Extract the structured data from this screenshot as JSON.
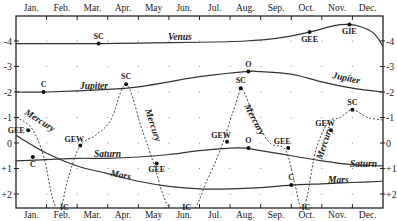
{
  "chart_data": {
    "type": "line",
    "title": "",
    "xlabel": "",
    "ylabel": "",
    "x_tick_labels": [
      "Jan.",
      "Feb.",
      "Mar.",
      "Apr.",
      "May",
      "Jun.",
      "Jul.",
      "Aug.",
      "Sep.",
      "Oct.",
      "Nov.",
      "Dec."
    ],
    "y_tick_labels_left": [
      "-4",
      "-3",
      "-2",
      "-1",
      "0",
      "+1",
      "+2"
    ],
    "y_tick_labels_right": [
      "-4",
      "-3",
      "-2",
      "-1",
      "0",
      "+1",
      "+2"
    ],
    "ylim": [
      2.5,
      -4.8
    ],
    "y_inverted": true,
    "grid": "dots",
    "x_unit": "month (fractional, 0 = Jan 1, 12 = Dec 31)",
    "series": [
      {
        "name": "Venus",
        "style": "solid",
        "points": [
          [
            0,
            -3.9
          ],
          [
            2,
            -3.9
          ],
          [
            2.7,
            -3.9
          ],
          [
            4,
            -3.92
          ],
          [
            6,
            -3.95
          ],
          [
            7.5,
            -4.0
          ],
          [
            8.5,
            -4.1
          ],
          [
            9.6,
            -4.35
          ],
          [
            10.4,
            -4.6
          ],
          [
            10.85,
            -4.65
          ],
          [
            11.3,
            -4.55
          ],
          [
            11.7,
            -4.3
          ],
          [
            12,
            -3.8
          ]
        ]
      },
      {
        "name": "Jupiter",
        "style": "solid",
        "points": [
          [
            0,
            -2.0
          ],
          [
            1,
            -2.0
          ],
          [
            3,
            -2.1
          ],
          [
            4,
            -2.2
          ],
          [
            5,
            -2.4
          ],
          [
            6,
            -2.6
          ],
          [
            7.5,
            -2.8
          ],
          [
            8,
            -2.8
          ],
          [
            9,
            -2.7
          ],
          [
            10,
            -2.4
          ],
          [
            11,
            -2.15
          ],
          [
            12,
            -2.0
          ]
        ]
      },
      {
        "name": "Saturn",
        "style": "solid",
        "points": [
          [
            0,
            0.7
          ],
          [
            1,
            0.65
          ],
          [
            2,
            0.6
          ],
          [
            3,
            0.6
          ],
          [
            4,
            0.55
          ],
          [
            5,
            0.45
          ],
          [
            6,
            0.3
          ],
          [
            7,
            0.2
          ],
          [
            7.5,
            0.2
          ],
          [
            8,
            0.3
          ],
          [
            9,
            0.5
          ],
          [
            10,
            0.7
          ],
          [
            11,
            0.85
          ],
          [
            12,
            0.9
          ]
        ]
      },
      {
        "name": "Mars",
        "style": "solid",
        "points": [
          [
            0,
            -0.3
          ],
          [
            1,
            0.4
          ],
          [
            2,
            0.9
          ],
          [
            3,
            1.2
          ],
          [
            4,
            1.5
          ],
          [
            5,
            1.7
          ],
          [
            6,
            1.8
          ],
          [
            7,
            1.8
          ],
          [
            8,
            1.75
          ],
          [
            9,
            1.65
          ],
          [
            10,
            1.6
          ],
          [
            11,
            1.55
          ],
          [
            12,
            1.5
          ]
        ]
      },
      {
        "name": "Mercury",
        "style": "dashed",
        "points": [
          [
            0,
            -1.0
          ],
          [
            0.5,
            -0.6
          ],
          [
            0.9,
            0.5
          ],
          [
            1.2,
            2.2
          ],
          [
            1.45,
            2.6
          ],
          [
            1.7,
            1.4
          ],
          [
            2.1,
            0.1
          ],
          [
            2.6,
            -0.3
          ],
          [
            3.1,
            -0.9
          ],
          [
            3.6,
            -2.3
          ],
          [
            4.1,
            -0.6
          ],
          [
            4.5,
            0.8
          ],
          [
            4.8,
            2.0
          ],
          [
            5.1,
            2.6
          ],
          [
            5.8,
            2.6
          ],
          [
            6.2,
            1.6
          ],
          [
            6.7,
            0.2
          ],
          [
            7.2,
            -1.6
          ],
          [
            7.4,
            -2.1
          ],
          [
            7.8,
            -1.0
          ],
          [
            8.3,
            0.0
          ],
          [
            8.8,
            0.25
          ],
          [
            9.1,
            1.5
          ],
          [
            9.3,
            2.5
          ],
          [
            9.5,
            2.2
          ],
          [
            9.8,
            0.3
          ],
          [
            10.2,
            -0.8
          ],
          [
            10.6,
            -1.0
          ],
          [
            11.0,
            -1.3
          ],
          [
            11.5,
            -1.0
          ],
          [
            12,
            -0.9
          ]
        ]
      }
    ],
    "events": [
      {
        "planet": "Venus",
        "label": "SC",
        "month": 2.7,
        "mag": -3.9
      },
      {
        "planet": "Venus",
        "label": "GEE",
        "month": 9.6,
        "mag": -4.35
      },
      {
        "planet": "Venus",
        "label": "GIE",
        "month": 10.9,
        "mag": -4.65
      },
      {
        "planet": "Jupiter",
        "label": "C",
        "month": 0.9,
        "mag": -2.0
      },
      {
        "planet": "Jupiter",
        "label": "O",
        "month": 7.6,
        "mag": -2.8
      },
      {
        "planet": "Mercury",
        "label": "SC",
        "month": 3.6,
        "mag": -2.3
      },
      {
        "planet": "Mercury",
        "label": "SC",
        "month": 7.35,
        "mag": -2.15
      },
      {
        "planet": "Mercury",
        "label": "SC",
        "month": 11.0,
        "mag": -1.3
      },
      {
        "planet": "Mercury",
        "label": "GEE",
        "month": 0.4,
        "mag": -0.5
      },
      {
        "planet": "Mercury",
        "label": "GEW",
        "month": 2.1,
        "mag": 0.1
      },
      {
        "planet": "Mercury",
        "label": "GEE",
        "month": 4.6,
        "mag": 0.8
      },
      {
        "planet": "Mercury",
        "label": "GEW",
        "month": 6.9,
        "mag": -0.05
      },
      {
        "planet": "Mercury",
        "label": "GEE",
        "month": 8.9,
        "mag": 0.2
      },
      {
        "planet": "Mercury",
        "label": "GEW",
        "month": 10.3,
        "mag": -0.5
      },
      {
        "planet": "Mercury",
        "label": "IC",
        "month": 1.45,
        "mag": 2.5
      },
      {
        "planet": "Mercury",
        "label": "IC",
        "month": 5.45,
        "mag": 2.5
      },
      {
        "planet": "Mercury",
        "label": "IC",
        "month": 9.35,
        "mag": 2.5
      },
      {
        "planet": "Saturn",
        "label": "C",
        "month": 0.55,
        "mag": 0.55
      },
      {
        "planet": "Saturn",
        "label": "O",
        "month": 7.6,
        "mag": 0.2
      },
      {
        "planet": "Mars",
        "label": "C",
        "month": 9.0,
        "mag": 1.65
      }
    ],
    "legend": "inline labels (Venus, Jupiter, Saturn, Mars, Mercury)"
  },
  "labels": {
    "venus": "Venus",
    "jupiter_left": "Jupiter",
    "jupiter_right": "Jupiter",
    "saturn_left": "Saturn",
    "saturn_right": "Saturn",
    "mars_left": "Mars",
    "mars_right": "Mars",
    "mercury_1": "Mercury",
    "mercury_2": "Mercury",
    "mercury_3": "Mercury",
    "mercury_4": "Mercury"
  }
}
